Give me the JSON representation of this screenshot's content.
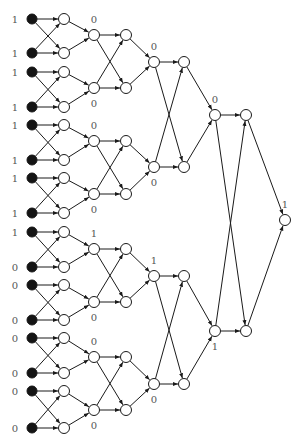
{
  "figure": {
    "type": "comparator-network",
    "inputs": {
      "rows_y": [
        19,
        53,
        72,
        107,
        125,
        160,
        178,
        213,
        232,
        267,
        285,
        320,
        338,
        373,
        391,
        428
      ],
      "values": [
        "1",
        "1",
        "1",
        "1",
        "1",
        "1",
        "1",
        "1",
        "1",
        "0",
        "0",
        "0",
        "0",
        "0",
        "0",
        "0"
      ]
    },
    "columns_x": {
      "label": 15,
      "input": 32,
      "layer1": 64,
      "layer2": 94,
      "layer3": 126,
      "layer4": 154,
      "layer5": 184,
      "layer6": 215,
      "layer7": 246,
      "output": 285
    },
    "layer2_nodes": [
      {
        "y": 35,
        "label": "0",
        "label_pos": "above"
      },
      {
        "y": 88,
        "label": "0",
        "label_pos": "below"
      },
      {
        "y": 141,
        "label": "0",
        "label_pos": "above"
      },
      {
        "y": 194,
        "label": "0",
        "label_pos": "below"
      },
      {
        "y": 249,
        "label": "1",
        "label_pos": "above"
      },
      {
        "y": 302,
        "label": "0",
        "label_pos": "below"
      },
      {
        "y": 357,
        "label": "0",
        "label_pos": "above"
      },
      {
        "y": 410,
        "label": "0",
        "label_pos": "below"
      }
    ],
    "layer4_nodes": [
      {
        "y": 62,
        "label": "0",
        "label_pos": "above"
      },
      {
        "y": 167,
        "label": "0",
        "label_pos": "below"
      },
      {
        "y": 276,
        "label": "1",
        "label_pos": "above"
      },
      {
        "y": 384,
        "label": "0",
        "label_pos": "below"
      }
    ],
    "layer6_nodes": [
      {
        "y": 115,
        "label": "0",
        "label_pos": "above"
      },
      {
        "y": 331,
        "label": "1",
        "label_pos": "below"
      }
    ],
    "output_node": {
      "y": 220,
      "label": "1",
      "label_pos": "above"
    }
  }
}
